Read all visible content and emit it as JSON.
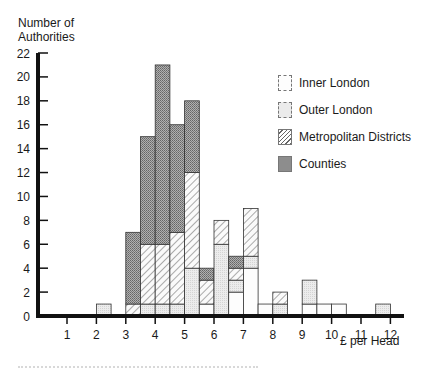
{
  "chart_data": {
    "type": "bar",
    "stacked": true,
    "title": "",
    "xlabel": "£ per Head",
    "ylabel": "Number of Authorities",
    "ylim": [
      0,
      22
    ],
    "xlim": [
      0.5,
      12.5
    ],
    "yticks": [
      0,
      2,
      4,
      6,
      8,
      10,
      12,
      14,
      16,
      18,
      20,
      22
    ],
    "xticks": [
      1,
      2,
      3,
      4,
      5,
      6,
      7,
      8,
      9,
      10,
      11,
      12
    ],
    "bin_width": 0.5,
    "legend_position": "upper right",
    "grid": false,
    "categories": [
      "2.0-2.5",
      "3.0-3.5",
      "3.5-4.0",
      "4.0-4.5",
      "4.5-5.0",
      "5.0-5.5",
      "5.5-6.0",
      "6.0-6.5",
      "6.5-7.0",
      "7.0-7.5",
      "7.5-8.0",
      "8.0-8.5",
      "9.0-9.5",
      "9.5-10.0",
      "10.0-10.5",
      "11.5-12.0"
    ],
    "bin_starts": [
      2.0,
      3.0,
      3.5,
      4.0,
      4.5,
      5.0,
      5.5,
      6.0,
      6.5,
      7.0,
      7.5,
      8.0,
      9.0,
      9.5,
      10.0,
      11.5
    ],
    "series": [
      {
        "name": "Inner London",
        "values": [
          0,
          0,
          0,
          0,
          0,
          0,
          1,
          0,
          2,
          4,
          1,
          0,
          1,
          1,
          1,
          0
        ]
      },
      {
        "name": "Outer London",
        "values": [
          1,
          0,
          1,
          1,
          1,
          4,
          0,
          6,
          1,
          1,
          0,
          1,
          2,
          0,
          0,
          1
        ]
      },
      {
        "name": "Metropolitan Districts",
        "values": [
          0,
          1,
          5,
          5,
          6,
          8,
          2,
          2,
          1,
          4,
          0,
          1,
          0,
          0,
          0,
          0
        ]
      },
      {
        "name": "Counties",
        "values": [
          0,
          6,
          9,
          15,
          9,
          6,
          1,
          0,
          1,
          0,
          0,
          0,
          0,
          0,
          0,
          0
        ]
      }
    ],
    "totals": [
      1,
      7,
      15,
      21,
      16,
      18,
      4,
      8,
      5,
      9,
      1,
      2,
      3,
      1,
      1,
      1
    ]
  },
  "axis": {
    "ylabel_line1": "Number of",
    "ylabel_line2": "Authorities",
    "xlabel": "£ per Head"
  },
  "legend": {
    "items": [
      {
        "label": "Inner London"
      },
      {
        "label": "Outer London"
      },
      {
        "label": "Metropolitan Districts"
      },
      {
        "label": "Counties"
      }
    ]
  }
}
